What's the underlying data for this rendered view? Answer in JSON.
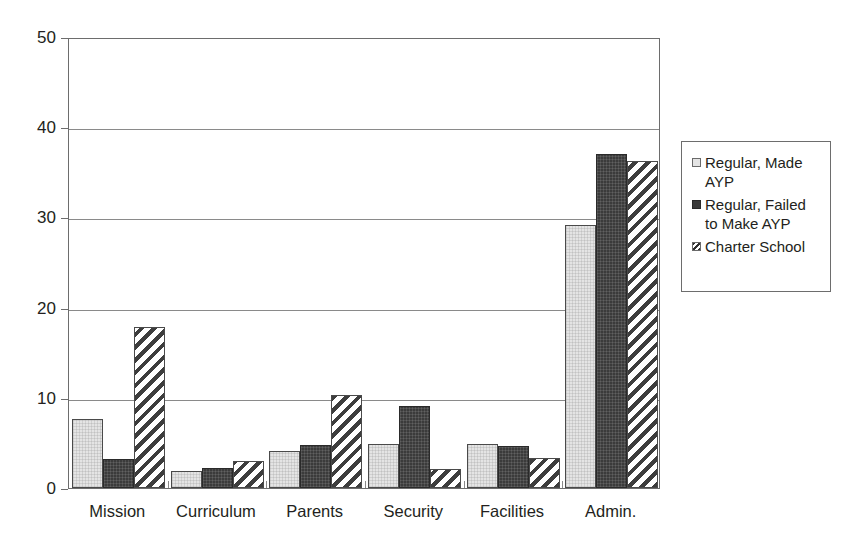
{
  "chart_data": {
    "type": "bar",
    "title": "",
    "subtitle": "",
    "xlabel": "",
    "ylabel": "",
    "ylim": [
      0,
      50
    ],
    "yticks": [
      0,
      10,
      20,
      30,
      40,
      50
    ],
    "ytick_labels": [
      "0",
      "10",
      "20",
      "30",
      "40",
      "50"
    ],
    "grid": true,
    "grid_axis": "y",
    "legend_position": "right",
    "categories": [
      "Mission",
      "Curriculum",
      "Parents",
      "Security",
      "Facilities",
      "Admin."
    ],
    "series": [
      {
        "name": "Regular, Made AYP",
        "legend_label": "Regular, Made\nAYP",
        "fill": "light-gray",
        "color": "#e4e4e4",
        "values": [
          7.6,
          1.9,
          4.1,
          4.9,
          4.9,
          29.2
        ]
      },
      {
        "name": "Regular, Failed to Make AYP",
        "legend_label": "Regular, Failed\nto Make AYP",
        "fill": "dark-solid",
        "color": "#3b3b3b",
        "values": [
          3.2,
          2.2,
          4.8,
          9.1,
          4.7,
          37.0
        ]
      },
      {
        "name": "Charter School",
        "legend_label": "Charter School",
        "fill": "diagonal-hatch",
        "color": "#3d3d3d",
        "values": [
          17.8,
          3.0,
          10.3,
          2.1,
          3.3,
          36.2
        ]
      }
    ]
  },
  "axis": {
    "y_labels": [
      "50",
      "40",
      "30",
      "20",
      "10",
      "0"
    ],
    "x_labels": [
      "Mission",
      "Curriculum",
      "Parents",
      "Security",
      "Facilities",
      "Admin."
    ]
  },
  "legend": {
    "entries": [
      {
        "label": "Regular, Made\nAYP",
        "swatch": "light-gray-swatch"
      },
      {
        "label": "Regular, Failed\nto Make AYP",
        "swatch": "dark-solid-swatch"
      },
      {
        "label": "Charter School",
        "swatch": "hatched-swatch"
      }
    ]
  }
}
